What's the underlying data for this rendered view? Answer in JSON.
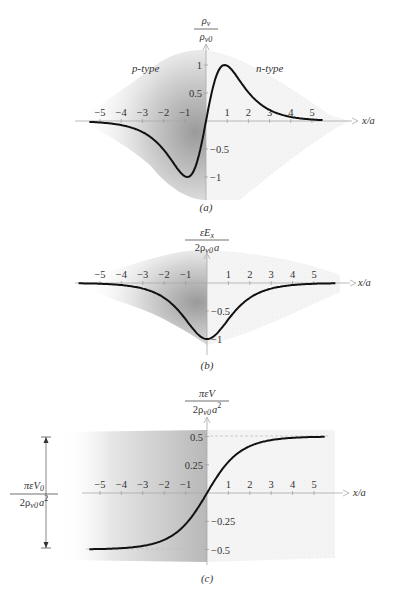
{
  "figure": {
    "panels": [
      {
        "id": "a",
        "caption": "(a)",
        "ylabel_num": "ρ",
        "ylabel_num_sub": "v",
        "ylabel_den": "ρ",
        "ylabel_den_sub": "v0",
        "region_left": "p-type",
        "region_right": "n-type",
        "xlabel": "x/a"
      },
      {
        "id": "b",
        "caption": "(b)",
        "ylabel_num": "εE",
        "ylabel_num_sub": "x",
        "ylabel_den": "2ρ",
        "ylabel_den_sub": "v0",
        "ylabel_den_tail": "a",
        "xlabel": "x/a"
      },
      {
        "id": "c",
        "caption": "(c)",
        "ylabel_num": "πεV",
        "ylabel_den": "2ρ",
        "ylabel_den_sub": "v0",
        "ylabel_den_tail": "a",
        "ylabel_den_sup": "2",
        "xlabel": "x/a",
        "bracket_num": "πεV",
        "bracket_num_sub": "0",
        "bracket_den": "2ρ",
        "bracket_den_sub": "v0",
        "bracket_den_tail": "a",
        "bracket_den_sup": "2"
      }
    ]
  },
  "chart_data": [
    {
      "type": "line",
      "title": "(a) Volume charge density across p-n junction",
      "xlabel": "x/a",
      "ylabel": "ρv/ρv0",
      "xlim": [
        -5.5,
        5.5
      ],
      "ylim": [
        -1,
        1
      ],
      "x_ticks": [
        -5,
        -4,
        -3,
        -2,
        -1,
        1,
        2,
        3,
        4,
        5
      ],
      "y_ticks": [
        1,
        0.5,
        -0.5,
        -1
      ],
      "annotations": [
        "p-type",
        "n-type"
      ],
      "series": [
        {
          "name": "ρv/ρv0 = 2 sech(x/a) tanh(x/a)",
          "x": [
            -5.5,
            -5,
            -4,
            -3,
            -2,
            -1.5,
            -1,
            -0.88,
            -0.5,
            0,
            0.5,
            0.88,
            1,
            1.5,
            2,
            3,
            4,
            5,
            5.5
          ],
          "values": [
            -0.016,
            -0.027,
            -0.073,
            -0.197,
            -0.507,
            -0.75,
            -0.987,
            -1.0,
            -0.786,
            0,
            0.786,
            1.0,
            0.987,
            0.75,
            0.507,
            0.197,
            0.073,
            0.027,
            0.016
          ]
        }
      ],
      "grid": false
    },
    {
      "type": "line",
      "title": "(b) Electric field",
      "xlabel": "x/a",
      "ylabel": "εEx/(2ρv0 a)",
      "xlim": [
        -6,
        6
      ],
      "ylim": [
        -1,
        0
      ],
      "x_ticks": [
        -5,
        -4,
        -3,
        -2,
        -1,
        1,
        2,
        3,
        4,
        5
      ],
      "y_ticks": [
        -0.5,
        -1
      ],
      "series": [
        {
          "name": "-sech(x/a)",
          "x": [
            -6,
            -5,
            -4,
            -3,
            -2,
            -1,
            -0.5,
            0,
            0.5,
            1,
            2,
            3,
            4,
            5,
            6
          ],
          "values": [
            -0.005,
            -0.013,
            -0.037,
            -0.099,
            -0.266,
            -0.648,
            -0.887,
            -1.0,
            -0.887,
            -0.648,
            -0.266,
            -0.099,
            -0.037,
            -0.013,
            -0.005
          ]
        }
      ],
      "grid": false
    },
    {
      "type": "line",
      "title": "(c) Potential",
      "xlabel": "x/a",
      "ylabel": "πεV/(2ρv0 a²)",
      "xlim": [
        -6,
        6
      ],
      "ylim": [
        -0.5,
        0.5
      ],
      "x_ticks": [
        -5,
        -4,
        -3,
        -2,
        -1,
        1,
        2,
        3,
        4,
        5
      ],
      "y_ticks": [
        0.5,
        0.25,
        -0.25,
        -0.5
      ],
      "annotations": [
        "πεV0/(2ρv0 a²) bracket spanning -0.5 to 0.5"
      ],
      "series": [
        {
          "name": "(2/π)arctan(e^(x/a)) - 1/2",
          "x": [
            -5.5,
            -5,
            -4,
            -3,
            -2,
            -1,
            0,
            1,
            2,
            3,
            4,
            5,
            5.5
          ],
          "values": [
            -0.497,
            -0.496,
            -0.488,
            -0.468,
            -0.414,
            -0.269,
            0,
            0.269,
            0.414,
            0.468,
            0.488,
            0.496,
            0.497
          ]
        }
      ],
      "grid": false
    }
  ]
}
